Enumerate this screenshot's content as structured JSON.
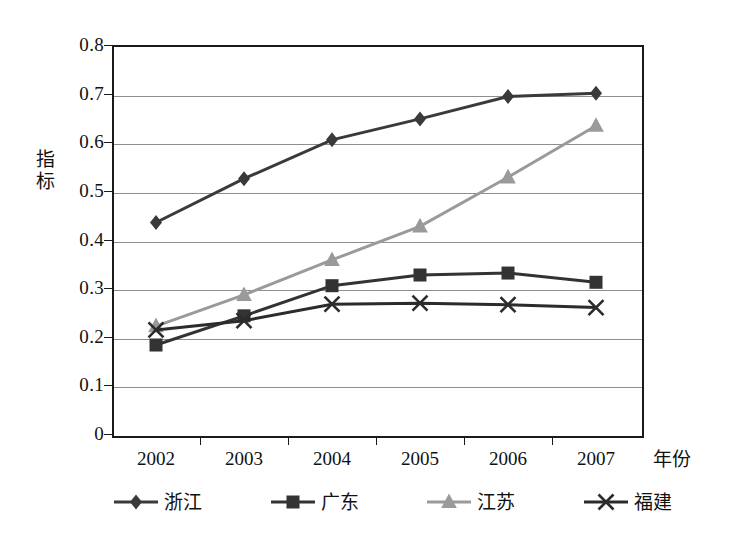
{
  "chart_data": {
    "type": "line",
    "title": "",
    "subtitle": "",
    "xlabel": "年份",
    "ylabel": "指标",
    "x": [
      "2002",
      "2003",
      "2004",
      "2005",
      "2006",
      "2007"
    ],
    "categories": [
      "2002",
      "2003",
      "2004",
      "2005",
      "2006",
      "2007"
    ],
    "ylim": [
      0,
      0.8
    ],
    "yticks": [
      "0",
      "0.1",
      "0.2",
      "0.3",
      "0.4",
      "0.5",
      "0.6",
      "0.7",
      "0.8"
    ],
    "ytick_values": [
      0,
      0.1,
      0.2,
      0.3,
      0.4,
      0.5,
      0.6,
      0.7,
      0.8
    ],
    "grid": true,
    "legend_position": "bottom",
    "series": [
      {
        "name": "浙江",
        "marker": "diamond",
        "color": "#3a3a3a",
        "values": [
          0.435,
          0.525,
          0.605,
          0.648,
          0.694,
          0.701
        ]
      },
      {
        "name": "广东",
        "marker": "square",
        "color": "#333333",
        "values": [
          0.183,
          0.243,
          0.305,
          0.327,
          0.331,
          0.312
        ]
      },
      {
        "name": "江苏",
        "marker": "triangle",
        "color": "#9a9a9a",
        "values": [
          0.222,
          0.286,
          0.358,
          0.427,
          0.528,
          0.634
        ]
      },
      {
        "name": "福建",
        "marker": "cross",
        "color": "#2b2b2b",
        "values": [
          0.214,
          0.233,
          0.267,
          0.269,
          0.266,
          0.26
        ]
      }
    ]
  },
  "axes": {
    "y_title": "指标",
    "x_title": "年份"
  },
  "colors": {
    "axis": "#1a1a1a",
    "grid": "#8e8e8e",
    "background": "#ffffff"
  }
}
